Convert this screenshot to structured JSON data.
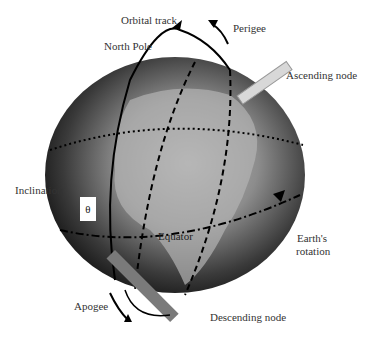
{
  "diagram": {
    "labels": {
      "orbital_track": "Orbital track",
      "perigee": "Perigee",
      "north_pole": "North Pole",
      "ascending_node": "Ascending node",
      "inclination": "Inclination",
      "theta": "θ",
      "equator": "Equator",
      "earths_rotation_line1": "Earth's",
      "earths_rotation_line2": "rotation",
      "apogee": "Apogee",
      "descending_node": "Descending node"
    },
    "colors": {
      "background": "#ffffff",
      "globe_dark": "#1a1a1a",
      "globe_land": "#9a9a9a",
      "node_marker_light": "#d8d8d8",
      "node_marker_dark": "#7a7a7a",
      "line": "#000000"
    }
  }
}
